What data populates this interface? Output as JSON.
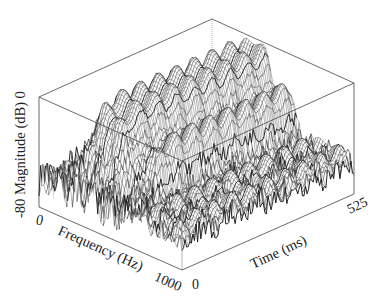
{
  "chart_data": {
    "type": "surface3d",
    "title": "",
    "axes": {
      "z": {
        "label": "Magnitude (dB)",
        "ticks": [
          "-80",
          "0"
        ],
        "range": [
          -80,
          0
        ]
      },
      "x": {
        "label": "Frequency (Hz)",
        "ticks": [
          "0",
          "1000"
        ],
        "range": [
          0,
          1000
        ]
      },
      "y": {
        "label": "Time (ms)",
        "ticks": [
          "0",
          "525"
        ],
        "range": [
          0,
          525
        ]
      }
    },
    "surface_features": [
      {
        "name": "main-ridge",
        "freq_hz": [
          150,
          450
        ],
        "time_ms": [
          60,
          525
        ],
        "peak_db": -5
      },
      {
        "name": "secondary-ridge",
        "freq_hz": [
          450,
          600
        ],
        "time_ms": [
          100,
          525
        ],
        "peak_db": -25
      },
      {
        "name": "noise-floor",
        "freq_hz": [
          600,
          1000
        ],
        "time_ms": [
          0,
          525
        ],
        "peak_db": -55
      }
    ],
    "grid": false,
    "box": true
  },
  "labels": {
    "z_axis": "-80 Magnitude (dB) 0",
    "x_axis": "Frequency (Hz)",
    "y_axis": "Time (ms)",
    "x_tick_min": "0",
    "x_tick_max": "1000",
    "y_tick_min": "0",
    "y_tick_max": "525"
  }
}
